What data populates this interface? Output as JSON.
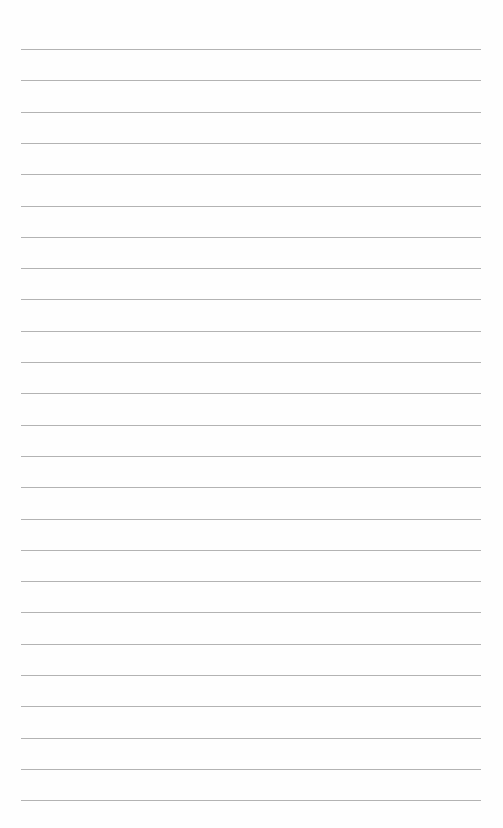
{
  "sheet": {
    "type": "lined-paper",
    "background": "#fefefe",
    "line_color": "#9a9a9a",
    "line_count": 25,
    "first_line_y": 49,
    "line_spacing": 31.3,
    "line_left": 21,
    "line_right": 481
  }
}
